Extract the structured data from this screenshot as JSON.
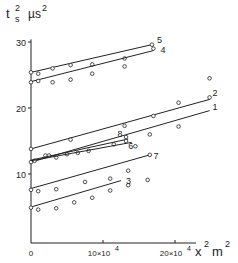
{
  "chart_data": {
    "type": "scatter",
    "title": "",
    "xlabel": "x² m²",
    "ylabel": "tₛ² µs²",
    "y_label_parts": {
      "t": "t",
      "sub": "s",
      "sup": "2",
      "unit": "µs",
      "unit_sup": "2"
    },
    "x_label_parts": {
      "x": "x",
      "sup": "2",
      "unit": "m",
      "unit_sup": "2"
    },
    "xlim": [
      0,
      24
    ],
    "ylim": [
      0,
      31
    ],
    "x_unit_scale": "10^4",
    "x_ticks": [
      {
        "value": 0,
        "label": "0"
      },
      {
        "value": 10,
        "label": "10×10",
        "exp": "4"
      },
      {
        "value": 20,
        "label": "20×10",
        "exp": "4"
      }
    ],
    "y_ticks": [
      {
        "value": 10,
        "label": "10"
      },
      {
        "value": 20,
        "label": "20"
      },
      {
        "value": 30,
        "label": "30"
      }
    ],
    "grid": false,
    "legend": "inline line labels",
    "series": [
      {
        "name": "5",
        "line": [
          [
            0,
            25.4
          ],
          [
            16.8,
            29.6
          ]
        ],
        "points": [
          [
            0,
            25.4
          ],
          [
            1,
            25.2
          ],
          [
            3,
            26.0
          ],
          [
            5.5,
            26.5
          ],
          [
            8.5,
            26.6
          ],
          [
            13,
            27.5
          ],
          [
            16.8,
            29.6
          ]
        ]
      },
      {
        "name": "4",
        "line": [
          [
            0,
            24.0
          ],
          [
            17,
            28.7
          ]
        ],
        "points": [
          [
            0,
            23.9
          ],
          [
            1,
            24.1
          ],
          [
            3,
            23.9
          ],
          [
            5.5,
            24.3
          ],
          [
            8.5,
            25.2
          ],
          [
            13,
            26.3
          ],
          [
            17,
            29.0
          ]
        ]
      },
      {
        "name": "2",
        "line": [
          [
            0,
            13.8
          ],
          [
            24.8,
            21.3
          ]
        ],
        "points": [
          [
            0,
            13.8
          ],
          [
            5.5,
            15.2
          ],
          [
            13,
            17.3
          ],
          [
            17,
            18.8
          ],
          [
            20.5,
            20.8
          ],
          [
            24.8,
            24.5
          ]
        ]
      },
      {
        "name": "1",
        "line": [
          [
            0,
            11.8
          ],
          [
            24.8,
            19.6
          ]
        ],
        "points": [
          [
            0,
            11.8
          ],
          [
            0.5,
            12.0
          ],
          [
            2,
            12.8
          ],
          [
            3.5,
            12.5
          ],
          [
            5,
            13.0
          ],
          [
            6.5,
            13.2
          ],
          [
            8,
            13.5
          ],
          [
            11.5,
            14.5
          ],
          [
            16.5,
            16.0
          ],
          [
            20.5,
            17.2
          ],
          [
            24.8,
            21.6
          ]
        ]
      },
      {
        "name": "6",
        "line": [
          [
            0,
            12.0
          ],
          [
            14,
            14.8
          ]
        ],
        "points": [
          [
            2.5,
            12.8
          ],
          [
            14.5,
            14.2
          ]
        ]
      },
      {
        "name": "8",
        "line": [
          [
            0,
            12.1
          ],
          [
            13.5,
            15.3
          ]
        ],
        "points": [
          [
            13.2,
            15.6
          ],
          [
            13.2,
            15.0
          ]
        ]
      },
      {
        "name": "7",
        "line": [
          [
            0,
            7.8
          ],
          [
            16.5,
            12.9
          ]
        ],
        "points": [
          [
            0,
            7.6
          ],
          [
            1,
            7.4
          ],
          [
            3.5,
            7.7
          ],
          [
            7.5,
            8.8
          ],
          [
            11,
            9.3
          ],
          [
            13.5,
            10.5
          ],
          [
            16.5,
            12.9
          ]
        ]
      },
      {
        "name": "3",
        "line": [
          [
            0,
            5.0
          ],
          [
            12.5,
            9.0
          ]
        ],
        "points": [
          [
            0,
            4.9
          ],
          [
            1,
            4.6
          ],
          [
            3.5,
            4.8
          ],
          [
            6,
            5.7
          ],
          [
            8.5,
            6.4
          ],
          [
            11,
            7.5
          ],
          [
            13.5,
            8.3
          ],
          [
            16.2,
            9.1
          ]
        ]
      }
    ],
    "annotations": [
      {
        "text": "5",
        "x": 17.5,
        "y": 30.3
      },
      {
        "text": "4",
        "x": 18,
        "y": 28.8
      },
      {
        "text": "2",
        "x": 25.2,
        "y": 22.3
      },
      {
        "text": "1",
        "x": 25.2,
        "y": 20.1
      },
      {
        "text": "8",
        "x": 12.0,
        "y": 16.0
      },
      {
        "text": "6",
        "x": 13.5,
        "y": 14.3
      },
      {
        "text": "7",
        "x": 17.0,
        "y": 12.8
      },
      {
        "text": "3",
        "x": 13.2,
        "y": 9.0
      }
    ]
  },
  "colors": {
    "ink": "#222222",
    "background": "#ffffff"
  }
}
